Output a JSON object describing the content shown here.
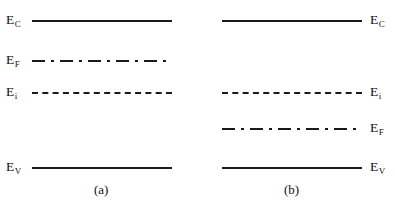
{
  "figure": {
    "canvas": {
      "width": 395,
      "height": 210,
      "background": "#ffffff"
    },
    "line_color": "#1a1a1a"
  },
  "panels": [
    {
      "id": "a",
      "caption": "(a)",
      "caption_x": 94,
      "caption_y": 183,
      "line_x": 32,
      "line_width": 140,
      "label_side": "left",
      "levels": [
        {
          "key": "Ec",
          "label_main": "E",
          "label_sub": "C",
          "style": "solid",
          "y": 20,
          "label_x": 6,
          "label_y": 13
        },
        {
          "key": "Ef",
          "label_main": "E",
          "label_sub": "F",
          "style": "dashdot",
          "y": 60,
          "label_x": 6,
          "label_y": 53
        },
        {
          "key": "Ei",
          "label_main": "E",
          "label_sub": "i",
          "style": "dashed",
          "y": 92,
          "label_x": 6,
          "label_y": 85
        },
        {
          "key": "Ev",
          "label_main": "E",
          "label_sub": "V",
          "style": "solid",
          "y": 167,
          "label_x": 6,
          "label_y": 160
        }
      ]
    },
    {
      "id": "b",
      "caption": "(b)",
      "caption_x": 284,
      "caption_y": 183,
      "line_x": 222,
      "line_width": 140,
      "label_side": "right",
      "levels": [
        {
          "key": "Ec",
          "label_main": "E",
          "label_sub": "C",
          "style": "solid",
          "y": 20,
          "label_x": 370,
          "label_y": 13
        },
        {
          "key": "Ei",
          "label_main": "E",
          "label_sub": "i",
          "style": "dashed",
          "y": 92,
          "label_x": 370,
          "label_y": 85
        },
        {
          "key": "Ef",
          "label_main": "E",
          "label_sub": "F",
          "style": "dashdot",
          "y": 128,
          "label_x": 370,
          "label_y": 121
        },
        {
          "key": "Ev",
          "label_main": "E",
          "label_sub": "V",
          "style": "solid",
          "y": 167,
          "label_x": 370,
          "label_y": 160
        }
      ]
    }
  ],
  "edge_fragment": {
    "text": "",
    "x": 30,
    "y": 203
  }
}
